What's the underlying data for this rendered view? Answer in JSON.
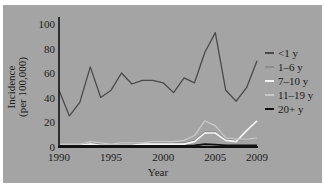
{
  "chart_data": {
    "type": "line",
    "title": "",
    "xlabel": "Year",
    "ylabel": "Incidence (per 100,000)",
    "ylabel_lines": [
      "Incidence",
      "(per 100,000)"
    ],
    "xlim": [
      1990,
      2009
    ],
    "ylim": [
      0,
      100
    ],
    "x_ticks": [
      1990,
      1995,
      2000,
      2005,
      2009
    ],
    "y_ticks": [
      0,
      20,
      40,
      60,
      80,
      100
    ],
    "grid": false,
    "legend_position": "right",
    "x": [
      1990,
      1991,
      1992,
      1993,
      1994,
      1995,
      1996,
      1997,
      1998,
      1999,
      2000,
      2001,
      2002,
      2003,
      2004,
      2005,
      2006,
      2007,
      2008,
      2009
    ],
    "series": [
      {
        "name": "<1 y",
        "color": "#4a4a4a",
        "width": 1.3,
        "values": [
          46,
          25,
          36,
          65,
          40,
          46,
          60,
          51,
          54,
          54,
          52,
          44,
          56,
          52,
          77,
          93,
          46,
          37,
          48,
          70
        ]
      },
      {
        "name": "1–6 y",
        "color": "#8c8c8c",
        "width": 1.3,
        "values": [
          2,
          1,
          2,
          4,
          2,
          2,
          2,
          2,
          3,
          3,
          3,
          3,
          3,
          5,
          12,
          12,
          6,
          5,
          6,
          7
        ]
      },
      {
        "name": "7–10 y",
        "color": "#f4f4f4",
        "width": 1.6,
        "values": [
          1,
          1,
          1,
          2,
          1,
          1,
          1,
          1,
          2,
          2,
          2,
          2,
          2,
          4,
          11,
          11,
          5,
          4,
          13,
          21
        ]
      },
      {
        "name": "11–19 y",
        "color": "#c8c8c8",
        "width": 1.3,
        "values": [
          2,
          2,
          2,
          4,
          3,
          2,
          3,
          3,
          3,
          4,
          4,
          4,
          5,
          9,
          21,
          17,
          7,
          6,
          6,
          7
        ]
      },
      {
        "name": "20+ y",
        "color": "#111111",
        "width": 1.8,
        "values": [
          0.5,
          0.5,
          0.5,
          0.5,
          0.5,
          0.5,
          0.5,
          0.5,
          0.5,
          0.5,
          0.5,
          0.5,
          0.5,
          0.8,
          2,
          1.5,
          1,
          0.8,
          0.8,
          0.8
        ]
      }
    ]
  }
}
